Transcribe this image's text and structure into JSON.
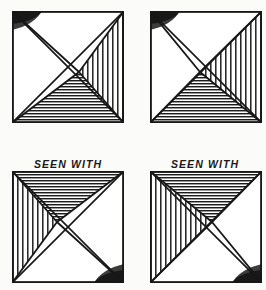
{
  "figure": {
    "background_color": "#fbfbf9",
    "ink_color": "#171717",
    "hatch_color": "#2a2a2a",
    "shade_color": "#4a4a4a"
  },
  "captions": {
    "left": {
      "line1": "SEEN WITH",
      "line2": "LEFT EYE"
    },
    "right": {
      "line1": "SEEN WITH",
      "line2": "RIGHT EYE"
    }
  },
  "panels": [
    {
      "id": "top-left",
      "name": "square-top-left",
      "rotation": 0,
      "crossing_x_fraction": 0.6,
      "crossing_y_fraction": 0.55,
      "regions": [
        {
          "name": "right-wedge",
          "fill": "vertical-hatch"
        },
        {
          "name": "bottom-wedge",
          "fill": "horizontal-hatch"
        },
        {
          "name": "top-left-corner-shade",
          "fill": "solid-dark-curve"
        },
        {
          "name": "left-wedge",
          "fill": "blank"
        },
        {
          "name": "top-wedge",
          "fill": "blank"
        }
      ]
    },
    {
      "id": "top-right",
      "name": "square-top-right",
      "rotation": 0,
      "crossing_x_fraction": 0.45,
      "crossing_y_fraction": 0.55,
      "regions": [
        {
          "name": "right-wedge",
          "fill": "vertical-hatch"
        },
        {
          "name": "bottom-wedge",
          "fill": "horizontal-hatch"
        },
        {
          "name": "top-left-corner-shade",
          "fill": "solid-dark-curve"
        },
        {
          "name": "left-wedge",
          "fill": "blank"
        },
        {
          "name": "top-wedge",
          "fill": "blank"
        }
      ]
    },
    {
      "id": "bottom-left",
      "name": "square-bottom-left",
      "rotation": 180,
      "crossing_x_fraction": 0.4,
      "crossing_y_fraction": 0.45,
      "regions": [
        {
          "name": "left-wedge",
          "fill": "vertical-hatch"
        },
        {
          "name": "top-wedge",
          "fill": "horizontal-hatch"
        },
        {
          "name": "bottom-right-corner-shade",
          "fill": "solid-dark-curve"
        },
        {
          "name": "right-wedge",
          "fill": "blank"
        },
        {
          "name": "bottom-wedge",
          "fill": "blank"
        }
      ]
    },
    {
      "id": "bottom-right",
      "name": "square-bottom-right",
      "rotation": 180,
      "crossing_x_fraction": 0.55,
      "crossing_y_fraction": 0.45,
      "regions": [
        {
          "name": "left-wedge",
          "fill": "vertical-hatch"
        },
        {
          "name": "top-wedge",
          "fill": "horizontal-hatch"
        },
        {
          "name": "bottom-right-corner-shade",
          "fill": "solid-dark-curve"
        },
        {
          "name": "right-wedge",
          "fill": "blank"
        },
        {
          "name": "bottom-wedge",
          "fill": "blank"
        }
      ]
    }
  ]
}
